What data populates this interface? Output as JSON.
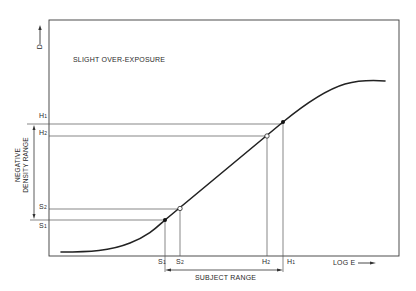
{
  "diagram": {
    "title": "SLIGHT OVER-EXPOSURE",
    "y_axis_label": "D",
    "x_axis_label": "LOG E",
    "y_range_label_line1": "NEGATIVE",
    "y_range_label_line2": "DENSITY RANGE",
    "x_range_label": "SUBJECT RANGE",
    "y_markers": [
      {
        "name": "H",
        "sub": "1"
      },
      {
        "name": "H",
        "sub": "2"
      },
      {
        "name": "S",
        "sub": "2"
      },
      {
        "name": "S",
        "sub": "1"
      }
    ],
    "x_markers": [
      {
        "name": "S",
        "sub": "1"
      },
      {
        "name": "S",
        "sub": "2"
      },
      {
        "name": "H",
        "sub": "2"
      },
      {
        "name": "H",
        "sub": "1"
      }
    ],
    "points": [
      {
        "label": "S1",
        "style": "filled"
      },
      {
        "label": "S2",
        "style": "open"
      },
      {
        "label": "H2",
        "style": "open"
      },
      {
        "label": "H1",
        "style": "filled"
      }
    ],
    "line_color": "#2a2a2a",
    "background": "#ffffff"
  }
}
